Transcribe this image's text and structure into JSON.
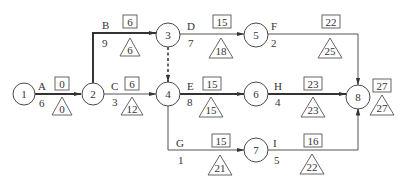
{
  "diagram": {
    "type": "activity-on-arrow network",
    "nodes": [
      {
        "id": "1",
        "label": "1"
      },
      {
        "id": "2",
        "label": "2"
      },
      {
        "id": "3",
        "label": "3"
      },
      {
        "id": "4",
        "label": "4"
      },
      {
        "id": "5",
        "label": "5"
      },
      {
        "id": "6",
        "label": "6"
      },
      {
        "id": "7",
        "label": "7"
      },
      {
        "id": "8",
        "label": "8"
      }
    ],
    "activities": [
      {
        "name": "A",
        "from": "1",
        "to": "2",
        "duration": "6",
        "box": "0",
        "triangle": "0",
        "critical": true
      },
      {
        "name": "B",
        "from": "2",
        "to": "3",
        "duration": "9",
        "box": "6",
        "triangle": "6",
        "critical": true
      },
      {
        "name": "C",
        "from": "2",
        "to": "4",
        "duration": "3",
        "box": "6",
        "triangle": "12",
        "critical": false
      },
      {
        "name": "D",
        "from": "3",
        "to": "5",
        "duration": "7",
        "box": "15",
        "triangle": "18",
        "critical": false
      },
      {
        "name": "E",
        "from": "4",
        "to": "6",
        "duration": "8",
        "box": "15",
        "triangle": "15",
        "critical": true
      },
      {
        "name": "F",
        "from": "5",
        "to": "8",
        "duration": "2",
        "box": "22",
        "triangle": "25",
        "critical": false
      },
      {
        "name": "G",
        "from": "4",
        "to": "7",
        "duration": "1",
        "box": "15",
        "triangle": "21",
        "critical": false
      },
      {
        "name": "H",
        "from": "6",
        "to": "8",
        "duration": "4",
        "box": "23",
        "triangle": "23",
        "critical": true
      },
      {
        "name": "I",
        "from": "7",
        "to": "8",
        "duration": "5",
        "box": "16",
        "triangle": "22",
        "critical": false
      }
    ],
    "dummy": {
      "from": "3",
      "to": "4",
      "style": "dashed"
    },
    "finish": {
      "box": "27",
      "triangle": "27"
    }
  }
}
